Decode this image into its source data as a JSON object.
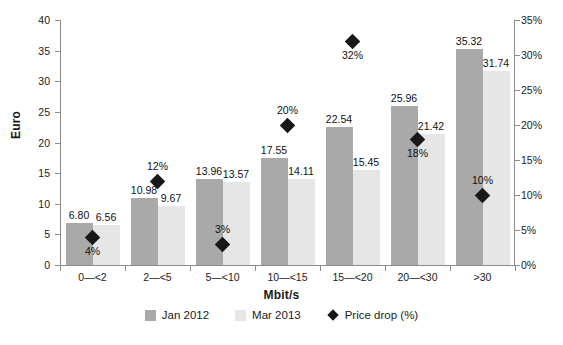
{
  "chart_data": {
    "type": "bar",
    "title": "",
    "categories": [
      "0—<2",
      "2—<5",
      "5—<10",
      "10—<15",
      "15—<20",
      "20—<30",
      ">30"
    ],
    "series": [
      {
        "name": "Jan 2012",
        "color": "#a9a9a9",
        "axis": "left",
        "values": [
          6.8,
          10.98,
          13.96,
          17.55,
          22.54,
          25.96,
          35.32
        ],
        "labels": [
          "6.80",
          "10.98",
          "13.96",
          "17.55",
          "22.54",
          "25.96",
          "35.32"
        ]
      },
      {
        "name": "Mar 2013",
        "color": "#e6e6e6",
        "axis": "left",
        "values": [
          6.56,
          9.67,
          13.57,
          14.11,
          15.45,
          21.42,
          31.74
        ],
        "labels": [
          "6.56",
          "9.67",
          "13.57",
          "14.11",
          "15.45",
          "21.42",
          "31.74"
        ]
      },
      {
        "name": "Price drop (%)",
        "color": "#181818",
        "axis": "right",
        "type": "scatter",
        "values": [
          4,
          12,
          3,
          20,
          32,
          18,
          10
        ],
        "labels": [
          "4%",
          "12%",
          "3%",
          "20%",
          "32%",
          "18%",
          "10%"
        ],
        "label_positions": [
          "below",
          "above",
          "above",
          "above",
          "below",
          "below",
          "above"
        ]
      }
    ],
    "xlabel": "Mbit/s",
    "ylabel": "Euro",
    "ylim": [
      0,
      40
    ],
    "yticks": [
      0,
      5,
      10,
      15,
      20,
      25,
      30,
      35,
      40
    ],
    "ytick_labels": [
      "0",
      "5",
      "10",
      "15",
      "20",
      "25",
      "30",
      "35",
      "40"
    ],
    "y2label": "",
    "y2lim": [
      0,
      35
    ],
    "y2ticks": [
      0,
      5,
      10,
      15,
      20,
      25,
      30,
      35
    ],
    "y2tick_labels": [
      "0%",
      "5%",
      "10%",
      "15%",
      "20%",
      "25%",
      "30%",
      "35%"
    ],
    "grid": false,
    "legend_position": "bottom"
  },
  "legend": {
    "items": [
      {
        "label": "Jan 2012",
        "marker": "square"
      },
      {
        "label": "Mar 2013",
        "marker": "square"
      },
      {
        "label": "Price drop (%)",
        "marker": "diamond"
      }
    ]
  },
  "bottom_caption": ""
}
